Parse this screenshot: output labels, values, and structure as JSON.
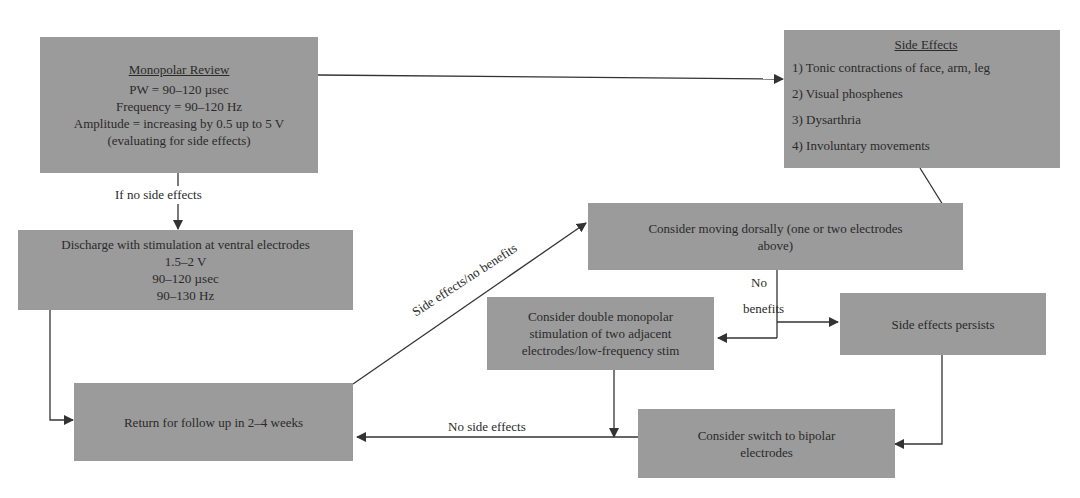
{
  "nodes": {
    "monopolar_review": {
      "title": "Monopolar Review",
      "lines": [
        "PW = 90–120 µsec",
        "Frequency = 90–120 Hz",
        "Amplitude = increasing by 0.5 up to 5 V",
        "(evaluating for side effects)"
      ]
    },
    "discharge": {
      "title": "Discharge with stimulation at ventral electrodes",
      "lines": [
        "1.5–2 V",
        "90–120 µsec",
        "90–130 Hz"
      ]
    },
    "return_followup": {
      "text": "Return for follow up in 2–4 weeks"
    },
    "side_effects": {
      "title": "Side Effects",
      "items": [
        "1) Tonic contractions of face, arm, leg",
        "2) Visual phosphenes",
        "3) Dysarthria",
        "4) Involuntary movements"
      ]
    },
    "moving_dorsally": {
      "lines": [
        "Consider moving dorsally (one or two electrodes",
        "above)"
      ]
    },
    "double_monopolar": {
      "lines": [
        "Consider double monopolar",
        "stimulation of two adjacent",
        "electrodes/low-frequency stim"
      ]
    },
    "side_effects_persists": {
      "text": "Side effects persists"
    },
    "switch_bipolar": {
      "lines": [
        "Consider switch to bipolar",
        "electrodes"
      ]
    }
  },
  "edge_labels": {
    "if_no_side_effects": "If no side effects",
    "side_effects_no_benefits": "Side effects/no benefits",
    "no": "No",
    "benefits": "benefits",
    "no_side_effects": "No side effects"
  },
  "colors": {
    "box_fill": "#9b9b9b",
    "line": "#333333"
  }
}
